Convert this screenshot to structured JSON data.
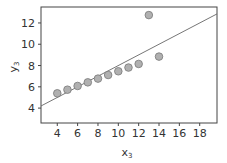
{
  "chart_data": {
    "type": "scatter",
    "title": "",
    "xlabel": "x3",
    "ylabel": "y3",
    "xlim": [
      2.4,
      19.7
    ],
    "ylim": [
      2.6,
      13.5
    ],
    "xticks": [
      4,
      6,
      8,
      10,
      12,
      14,
      16,
      18
    ],
    "yticks": [
      4,
      6,
      8,
      10,
      12
    ],
    "grid": false,
    "legend": null,
    "series": [
      {
        "name": "data",
        "x": [
          10,
          8,
          13,
          9,
          11,
          14,
          6,
          4,
          12,
          7,
          5
        ],
        "y": [
          7.46,
          6.77,
          12.74,
          7.11,
          7.81,
          8.84,
          6.08,
          5.39,
          8.15,
          6.42,
          5.73
        ],
        "marker_color": "#b0b0b0"
      }
    ],
    "fit_line": {
      "intercept": 3.0,
      "slope": 0.5,
      "color": "#666666"
    }
  },
  "axes": {
    "x_label_main": "x",
    "x_label_sub": "3",
    "y_label_main": "y",
    "y_label_sub": "3"
  }
}
